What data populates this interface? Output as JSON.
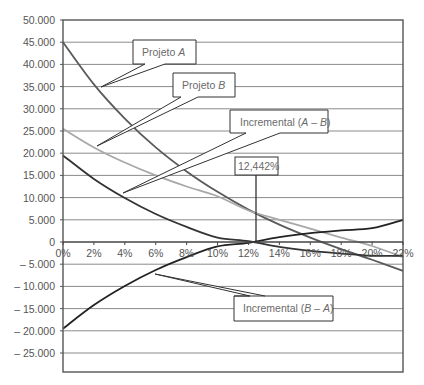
{
  "chart_data": {
    "type": "line",
    "title": "",
    "xlabel": "",
    "ylabel": "",
    "x": [
      0,
      2,
      4,
      6,
      8,
      10,
      12,
      14,
      16,
      18,
      20,
      22
    ],
    "x_tick_labels": [
      "0%",
      "2%",
      "4%",
      "6%",
      "8%",
      "10%",
      "12%",
      "14%",
      "16%",
      "18%",
      "20%",
      "22%"
    ],
    "y_ticks": [
      50000,
      45000,
      40000,
      35000,
      30000,
      25000,
      20000,
      15000,
      10000,
      5000,
      0,
      -5000,
      -10000,
      -15000,
      -20000,
      -25000
    ],
    "y_tick_labels": [
      "50.000",
      "45.000",
      "40.000",
      "35.000",
      "30.000",
      "25.000",
      "20.000",
      "15.000",
      "10.000",
      "5.000",
      "0",
      "– 5.000",
      "– 10.000",
      "– 15.000",
      "– 20.000",
      "– 25.000"
    ],
    "xlim": [
      0,
      22
    ],
    "ylim": [
      -29300,
      50000
    ],
    "grid": "horizontal",
    "legend": "none (callout labels)",
    "series": [
      {
        "name": "Projeto A",
        "color": "#5a5a5a",
        "values": [
          45000,
          35500,
          27800,
          21300,
          15900,
          11300,
          7300,
          3900,
          1000,
          -1600,
          -4000,
          -6500
        ]
      },
      {
        "name": "Projeto B",
        "color": "#a8a8a8",
        "values": [
          25500,
          21300,
          17900,
          15000,
          12500,
          10300,
          7100,
          5000,
          3000,
          1000,
          -900,
          -3400
        ]
      },
      {
        "name": "Incremental (A – B)",
        "color": "#333333",
        "values": [
          19500,
          14200,
          9900,
          6300,
          3400,
          1000,
          200,
          -1100,
          -2000,
          -2600,
          -3100,
          -3100
        ]
      },
      {
        "name": "Incremental (B – A)",
        "color": "#222222",
        "values": [
          -19500,
          -14200,
          -9900,
          -6300,
          -3400,
          -1000,
          -200,
          1100,
          2000,
          2600,
          3100,
          5000
        ]
      }
    ],
    "annotations": [
      {
        "text": "Projeto A",
        "italic_part": "A"
      },
      {
        "text": "Projeto B",
        "italic_part": "B"
      },
      {
        "text": "Incremental (A – B)"
      },
      {
        "text": "12,442%",
        "x": 12.442,
        "y": 0
      },
      {
        "text": "Incremental (B – A)"
      }
    ]
  },
  "callouts": {
    "projeto_a": {
      "prefix": "Projeto ",
      "italic": "A"
    },
    "projeto_b": {
      "prefix": "Projeto ",
      "italic": "B"
    },
    "inc_ab": {
      "prefix": "Incremental (",
      "italic1": "A",
      "mid": " – ",
      "italic2": "B",
      "suffix": ")"
    },
    "irr": {
      "label": "12,442%"
    },
    "inc_ba": {
      "prefix": "Incremental (",
      "italic1": "B",
      "mid": " – ",
      "italic2": "A",
      "suffix": ")"
    }
  }
}
